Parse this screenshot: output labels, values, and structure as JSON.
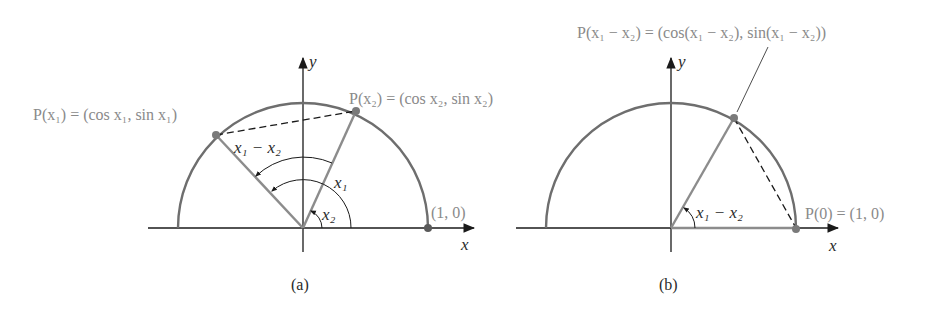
{
  "colors": {
    "arc": "#6e6e6e",
    "segment": "#8c8c8c",
    "axis": "#1a1a1a",
    "point": "#7a7a7a",
    "label_gray": "#8a8a8a",
    "label_dark": "#2a2a2a"
  },
  "panel_a": {
    "caption": "(a)",
    "x_axis_label": "x",
    "y_axis_label": "y",
    "point_x1_label": "P(x₁) = (cos x₁, sin x₁)",
    "point_x2_label": "P(x₂) = (cos x₂, sin x₂)",
    "point_1_0_label": "(1, 0)",
    "chord_label": "x₁ − x₂",
    "angle_x1_label": "x₁",
    "angle_x2_label": "x₂"
  },
  "panel_b": {
    "caption": "(b)",
    "x_axis_label": "x",
    "y_axis_label": "y",
    "point_diff_label": "P(x₁ − x₂) = (cos(x₁ − x₂), sin(x₁ − x₂))",
    "point_zero_label": "P(0) = (1, 0)",
    "angle_diff_label": "x₁ − x₂"
  }
}
